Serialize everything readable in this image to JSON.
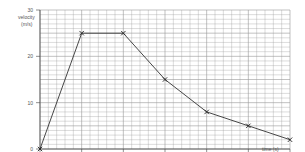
{
  "chart_data": {
    "type": "line",
    "title": "",
    "xlabel": "time (s)",
    "ylabel_line1": "velocity",
    "ylabel_line2": "(m/s)",
    "xlim": [
      0,
      60
    ],
    "ylim": [
      0,
      30
    ],
    "grid": true,
    "x_ticks": [
      "0",
      "10",
      "20",
      "30",
      "40",
      "50",
      "60"
    ],
    "y_ticks": [
      "0",
      "10",
      "20",
      "30"
    ],
    "x": [
      0,
      10,
      20,
      30,
      40,
      50,
      60
    ],
    "values": [
      0,
      25,
      25,
      15,
      8,
      5,
      2
    ],
    "marker": "x",
    "line_color": "#333333",
    "grid_color": "#999999"
  }
}
